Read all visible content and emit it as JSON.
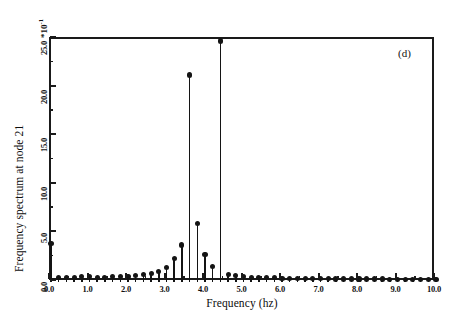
{
  "figure": {
    "panel_label": "(d)",
    "background_color": "#ffffff",
    "line_color": "#141414"
  },
  "axes": {
    "y_multiplier_label": "*10",
    "y_multiplier_exponent": "-1",
    "y_axis_title": "Frequency spectrum at node 21",
    "x_axis_title": "Frequency (hz)",
    "y_tick_labels": [
      "0.0",
      "5.0",
      "10.0",
      "15.0",
      "20.0",
      "25.0"
    ],
    "x_tick_labels": [
      "0.0",
      "1.0",
      "2.0",
      "3.0",
      "4.0",
      "5.0",
      "6.0",
      "7.0",
      "8.0",
      "9.0",
      "10.0"
    ]
  },
  "chart_data": {
    "type": "line",
    "plot_style": "stem",
    "title": "",
    "subtitle": "",
    "panel": "(d)",
    "xlabel": "Frequency (hz)",
    "ylabel": "Frequency spectrum at node 21",
    "y_multiplier": "*10^-1",
    "xlim": [
      0.0,
      10.0
    ],
    "ylim": [
      0.0,
      25.0
    ],
    "x_ticks": [
      0.0,
      1.0,
      2.0,
      3.0,
      4.0,
      5.0,
      6.0,
      7.0,
      8.0,
      9.0,
      10.0
    ],
    "y_ticks": [
      0.0,
      5.0,
      10.0,
      15.0,
      20.0,
      25.0
    ],
    "x_minor_tick_step": 0.5,
    "y_minor_tick_step": 2.5,
    "grid": false,
    "legend": null,
    "marker": "filled-circle",
    "series": [
      {
        "name": "Frequency spectrum at node 21",
        "x": [
          0.0,
          0.2,
          0.4,
          0.6,
          0.8,
          1.0,
          1.2,
          1.4,
          1.6,
          1.8,
          2.0,
          2.2,
          2.4,
          2.6,
          2.8,
          3.0,
          3.2,
          3.4,
          3.6,
          3.8,
          4.0,
          4.2,
          4.4,
          4.6,
          4.8,
          5.0,
          5.2,
          5.4,
          5.6,
          5.8,
          6.0,
          6.2,
          6.4,
          6.6,
          6.8,
          7.0,
          7.2,
          7.4,
          7.6,
          7.8,
          8.0,
          8.2,
          8.4,
          8.6,
          8.8,
          9.0,
          9.2,
          9.4,
          9.6,
          9.8,
          10.0
        ],
        "values": [
          4.0,
          0.5,
          0.5,
          0.5,
          0.55,
          0.6,
          0.5,
          0.5,
          0.55,
          0.6,
          0.6,
          0.7,
          0.8,
          0.9,
          1.1,
          1.5,
          2.4,
          3.8,
          21.3,
          6.0,
          2.8,
          1.6,
          24.8,
          0.8,
          0.7,
          0.6,
          0.5,
          0.5,
          0.5,
          0.45,
          0.4,
          0.4,
          0.4,
          0.4,
          0.35,
          0.35,
          0.35,
          0.3,
          0.3,
          0.3,
          0.3,
          0.3,
          0.3,
          0.3,
          0.28,
          0.28,
          0.28,
          0.25,
          0.25,
          0.25,
          0.25
        ]
      }
    ],
    "annotations": [
      {
        "text": "(d)",
        "x": 9.1,
        "y": 24.0
      }
    ],
    "notable_peaks": [
      {
        "frequency": 3.6,
        "value": 21.3
      },
      {
        "frequency": 4.4,
        "value": 24.8
      },
      {
        "frequency": 0.0,
        "value": 4.0
      },
      {
        "frequency": 3.8,
        "value": 6.0
      }
    ]
  }
}
